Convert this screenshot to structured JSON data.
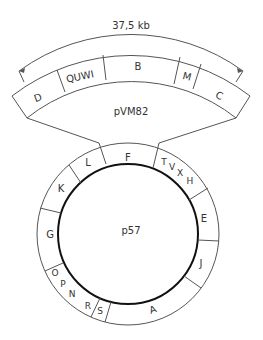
{
  "scale": {
    "label": "37,5 kb"
  },
  "plasmid_large": {
    "name": "pVM82",
    "segments": [
      "D",
      "QUWI",
      "B",
      "M",
      "C"
    ]
  },
  "plasmid_small": {
    "name": "p57",
    "segments": [
      "F",
      "T",
      "V",
      "X",
      "H",
      "E",
      "J",
      "A",
      "S",
      "R",
      "N",
      "P",
      "O",
      "G",
      "K",
      "L"
    ]
  },
  "colors": {
    "line": "#555555",
    "thick_line": "#111111",
    "text": "#333333"
  }
}
